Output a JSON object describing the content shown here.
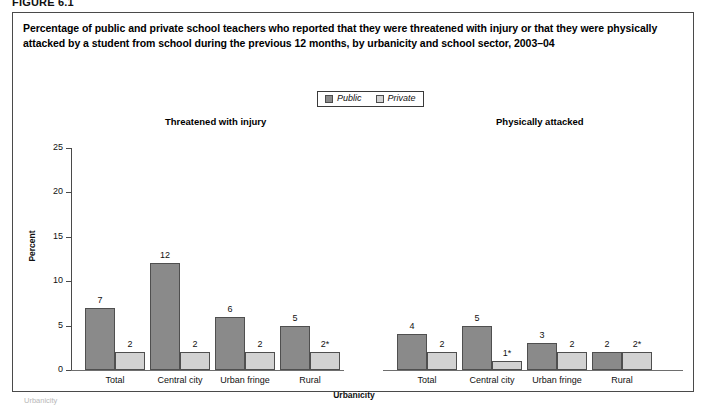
{
  "figure": {
    "number_label": "FIGURE 6.1",
    "title": "Percentage of public and private school teachers who reported that they were threatened with injury or that they were physically attacked by a student from school during the previous 12 months, by urbanicity and school sector, 2003–04",
    "footnote": "Urbanicity"
  },
  "legend": {
    "entries": [
      {
        "label": "Public",
        "color": "#8a8a8a",
        "swatch_icon": "square-swatch-icon"
      },
      {
        "label": "Private",
        "color": "#d2d2d2",
        "swatch_icon": "square-swatch-icon"
      }
    ]
  },
  "axes": {
    "y_title": "Percent",
    "x_title": "Urbanicity",
    "y_ticks": [
      "0",
      "5",
      "10",
      "15",
      "20",
      "25"
    ]
  },
  "chart_data": {
    "type": "bar",
    "title": "Percentage of public and private school teachers who reported that they were threatened with injury or that they were physically attacked by a student from school during the previous 12 months, by urbanicity and school sector, 2003–04",
    "xlabel": "Urbanicity",
    "ylabel": "Percent",
    "ylim": [
      0,
      25
    ],
    "yticks": [
      0,
      5,
      10,
      15,
      20,
      25
    ],
    "grid": false,
    "legend_position": "top-center",
    "categories": [
      "Total",
      "Central city",
      "Urban fringe",
      "Rural"
    ],
    "panels": [
      {
        "name": "Threatened with injury",
        "series": [
          {
            "name": "Public",
            "values": [
              7,
              12,
              6,
              5
            ],
            "labels": [
              "7",
              "12",
              "6",
              "5"
            ]
          },
          {
            "name": "Private",
            "values": [
              2,
              2,
              2,
              2
            ],
            "labels": [
              "2",
              "2",
              "2",
              "2*"
            ]
          }
        ]
      },
      {
        "name": "Physically attacked",
        "series": [
          {
            "name": "Public",
            "values": [
              4,
              5,
              3,
              2
            ],
            "labels": [
              "4",
              "5",
              "3",
              "2"
            ]
          },
          {
            "name": "Private",
            "values": [
              2,
              1,
              2,
              2
            ],
            "labels": [
              "2",
              "1*",
              "2",
              "2*"
            ]
          }
        ]
      }
    ],
    "annotations": [
      "* Interpret data with caution."
    ]
  }
}
